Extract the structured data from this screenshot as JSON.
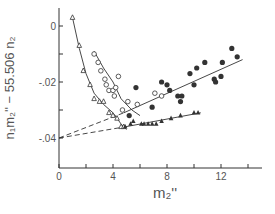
{
  "chart_data": {
    "type": "scatter",
    "title": "",
    "xlabel": "m₂''",
    "ylabel": "n₁m₂'' − 55.506 n₂",
    "xlim": [
      0,
      15
    ],
    "ylim": [
      -0.05,
      0.006
    ],
    "x_ticks": [
      0,
      2,
      4,
      6,
      8,
      10,
      12,
      14
    ],
    "x_tick_labels": [
      "0",
      "",
      "4",
      "",
      "8",
      "",
      "12",
      ""
    ],
    "y_ticks": [
      0,
      -0.01,
      -0.02,
      -0.03,
      -0.04
    ],
    "y_tick_labels": [
      "0",
      "",
      "-.02",
      "",
      "-.04"
    ],
    "grid": false,
    "legend": null,
    "series": [
      {
        "name": "open-triangles",
        "marker": "open-triangle",
        "points": [
          [
            1.0,
            0.003
          ],
          [
            1.5,
            -0.007
          ],
          [
            1.8,
            -0.016
          ],
          [
            2.3,
            -0.021
          ],
          [
            2.6,
            -0.026
          ],
          [
            3.0,
            -0.027
          ],
          [
            3.3,
            -0.027
          ],
          [
            3.7,
            -0.031
          ],
          [
            4.0,
            -0.032
          ],
          [
            4.3,
            -0.033
          ],
          [
            4.6,
            -0.036
          ],
          [
            4.8,
            -0.036
          ]
        ]
      },
      {
        "name": "open-circles",
        "marker": "open-circle",
        "points": [
          [
            2.6,
            -0.01
          ],
          [
            2.9,
            -0.013
          ],
          [
            3.1,
            -0.016
          ],
          [
            3.4,
            -0.019
          ],
          [
            3.5,
            -0.021
          ],
          [
            3.7,
            -0.023
          ],
          [
            4.0,
            -0.023
          ],
          [
            4.2,
            -0.022
          ],
          [
            4.4,
            -0.018
          ],
          [
            4.1,
            -0.025
          ],
          [
            5.1,
            -0.027
          ],
          [
            4.7,
            -0.03
          ],
          [
            5.8,
            -0.028
          ],
          [
            7.1,
            -0.024
          ],
          [
            7.6,
            -0.025
          ]
        ]
      },
      {
        "name": "filled-circles",
        "marker": "filled-circle",
        "points": [
          [
            5.2,
            -0.032
          ],
          [
            5.7,
            -0.022
          ],
          [
            6.9,
            -0.029
          ],
          [
            7.6,
            -0.02
          ],
          [
            8.0,
            -0.021
          ],
          [
            8.2,
            -0.023
          ],
          [
            8.8,
            -0.025
          ],
          [
            9.0,
            -0.027
          ],
          [
            9.1,
            -0.025
          ],
          [
            9.7,
            -0.017
          ],
          [
            10.2,
            -0.015
          ],
          [
            10.8,
            -0.013
          ],
          [
            10.0,
            -0.021
          ],
          [
            11.5,
            -0.019
          ],
          [
            11.6,
            -0.02
          ],
          [
            12.1,
            -0.013
          ],
          [
            12.0,
            -0.018
          ],
          [
            12.8,
            -0.008
          ],
          [
            13.2,
            -0.011
          ]
        ]
      },
      {
        "name": "filled-triangles",
        "marker": "filled-triangle",
        "points": [
          [
            4.9,
            -0.036
          ],
          [
            5.3,
            -0.035
          ],
          [
            5.5,
            -0.034
          ],
          [
            6.1,
            -0.035
          ],
          [
            6.3,
            -0.035
          ],
          [
            6.6,
            -0.035
          ],
          [
            6.9,
            -0.035
          ],
          [
            7.2,
            -0.035
          ],
          [
            7.6,
            -0.034
          ],
          [
            8.3,
            -0.033
          ],
          [
            9.0,
            -0.032
          ],
          [
            10.0,
            -0.031
          ],
          [
            10.3,
            -0.031
          ]
        ]
      }
    ],
    "lines": [
      {
        "name": "open-triangle-curve",
        "style": "solid",
        "points": [
          [
            1.0,
            0.003
          ],
          [
            1.5,
            -0.008
          ],
          [
            2.0,
            -0.017
          ],
          [
            2.6,
            -0.024
          ],
          [
            3.3,
            -0.028
          ],
          [
            4.0,
            -0.031
          ],
          [
            4.6,
            -0.035
          ],
          [
            5.0,
            -0.037
          ]
        ]
      },
      {
        "name": "open-circle-curve",
        "style": "solid",
        "points": [
          [
            2.6,
            -0.009
          ],
          [
            3.3,
            -0.015
          ],
          [
            4.0,
            -0.02
          ],
          [
            4.6,
            -0.026
          ],
          [
            5.4,
            -0.03
          ],
          [
            6.0,
            -0.032
          ]
        ]
      },
      {
        "name": "filled-circle-fit",
        "style": "solid",
        "points": [
          [
            4.8,
            -0.031
          ],
          [
            13.6,
            -0.012
          ]
        ]
      },
      {
        "name": "filled-circle-extrapolation",
        "style": "dashed",
        "points": [
          [
            0,
            -0.04
          ],
          [
            4.8,
            -0.031
          ]
        ]
      },
      {
        "name": "filled-triangle-fit",
        "style": "solid",
        "points": [
          [
            4.9,
            -0.036
          ],
          [
            10.5,
            -0.031
          ]
        ]
      },
      {
        "name": "filled-triangle-extrapolation",
        "style": "dashed",
        "points": [
          [
            0,
            -0.04
          ],
          [
            4.9,
            -0.036
          ]
        ]
      }
    ]
  },
  "plot_frame": {
    "x0_px": 59,
    "x_px_per_unit": 13.5,
    "y0_px": 26,
    "y_px_per_unit": 2800,
    "axis_x_end_px": 262,
    "axis_y_top_px": 8,
    "axis_y_bottom_px": 168
  },
  "colors": {
    "ink": "#333333",
    "text": "#555555",
    "background": "#ffffff"
  }
}
